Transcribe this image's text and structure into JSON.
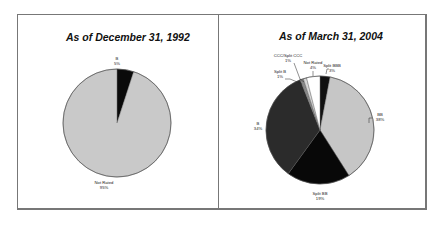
{
  "chart_data": [
    {
      "type": "pie",
      "title": "As of December 31, 1992",
      "categories": [
        "B",
        "Not Rated"
      ],
      "values": [
        5,
        95
      ],
      "labels": [
        {
          "name": "B",
          "pct": "5%"
        },
        {
          "name": "Not Rated",
          "pct": "95%"
        }
      ],
      "colors": [
        "#0a0a0a",
        "#c9c9c9"
      ],
      "legend": "none (data labels on slices)"
    },
    {
      "type": "pie",
      "title": "As of March 31, 2004",
      "categories": [
        "Split BBB",
        "BB",
        "Split BB",
        "B",
        "Split B",
        "CCC/Split CCC",
        "Not Rated"
      ],
      "values": [
        3,
        38,
        19,
        34,
        1,
        1,
        4
      ],
      "labels": [
        {
          "name": "Split BBB",
          "pct": "3%"
        },
        {
          "name": "BB",
          "pct": "38%"
        },
        {
          "name": "Split BB",
          "pct": "19%"
        },
        {
          "name": "B",
          "pct": "34%"
        },
        {
          "name": "Split B",
          "pct": "1%"
        },
        {
          "name": "CCC/Split CCC",
          "pct": "1%"
        },
        {
          "name": "Not Rated",
          "pct": "4%"
        }
      ],
      "colors": [
        "#111111",
        "#c6c6c6",
        "#080808",
        "#2b2b2b",
        "#8a8a8a",
        "#d8d8d8",
        "#ffffff"
      ],
      "legend": "none (data labels with leader lines)"
    }
  ]
}
